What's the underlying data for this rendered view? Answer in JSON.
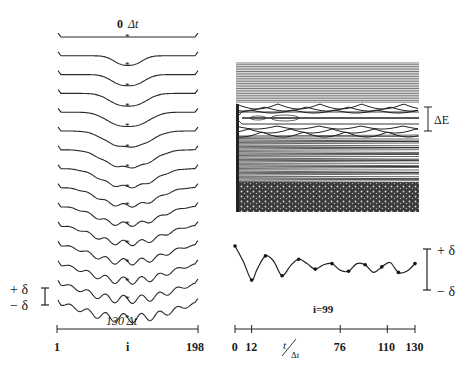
{
  "figure": {
    "left_panel": {
      "top_label": "0 Δt",
      "bottom_label": "130 Δt",
      "x_axis": {
        "ticks": [
          "1",
          "i",
          "198"
        ]
      },
      "scale_bar": {
        "plus": "+ δ",
        "minus": "− δ"
      },
      "n_snapshots": 15
    },
    "right_top_panel": {
      "gap_label": "ΔE"
    },
    "right_bottom_panel": {
      "site_label": "i=99",
      "x_axis": {
        "ticks": [
          "0",
          "12",
          "76",
          "110",
          "130"
        ],
        "label_num": "t",
        "label_den": "Δt"
      },
      "scale_bar": {
        "plus": "+ δ",
        "minus": "− δ"
      }
    }
  },
  "chart_data": [
    {
      "type": "line",
      "title": "Snapshots of lattice distortion profile vs. site index",
      "xlabel": "i",
      "x_ticks": [
        "1",
        "i",
        "198"
      ],
      "xlim": [
        1,
        198
      ],
      "time_range_label": [
        "0 Δt",
        "130 Δt"
      ],
      "series_count": 15,
      "notes": "Stacked curves, each offset vertically; center site marked with asterisk. Profile evolves from flat to a dip that splits and develops oscillatory ripples."
    },
    {
      "type": "line",
      "title": "Electronic energy levels vs. time",
      "ylabel": "ΔE (gap)",
      "notes": "Dense band of levels above and below a gap containing a mid-gap level; levels oscillate in time."
    },
    {
      "type": "line",
      "title": "Displacement at site i=99 vs time",
      "xlabel": "t/Δt",
      "x_ticks": [
        0,
        12,
        76,
        110,
        130
      ],
      "xlim": [
        0,
        130
      ],
      "ylabel": "δ",
      "x": [
        0,
        6,
        12,
        16,
        22,
        28,
        34,
        40,
        46,
        52,
        58,
        64,
        70,
        76,
        82,
        88,
        94,
        100,
        106,
        112,
        118,
        124,
        130
      ],
      "values": [
        1.0,
        0.3,
        -0.55,
        -0.05,
        0.55,
        0.3,
        -0.35,
        0.1,
        0.4,
        0.2,
        -0.05,
        0.15,
        0.2,
        -0.1,
        -0.15,
        0.2,
        0.15,
        -0.2,
        0.05,
        0.25,
        -0.2,
        -0.15,
        0.2
      ]
    }
  ]
}
